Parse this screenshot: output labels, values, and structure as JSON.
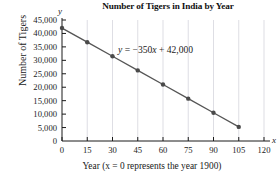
{
  "chart_data": {
    "type": "line",
    "title": "Number of Tigers in India by Year",
    "xlabel": "Year (x = 0 represents the year 1900)",
    "ylabel": "Number of Tigers",
    "x_axis_variable": "x",
    "y_axis_variable": "y",
    "annotation": "y = −350x + 42,000",
    "annotation_parts": {
      "lhs": "y",
      "rhs": " = −350",
      "var": "x",
      "tail": " + 42,000"
    },
    "x": [
      0,
      15,
      30,
      45,
      60,
      75,
      90,
      105
    ],
    "values": [
      42000,
      36750,
      31500,
      26250,
      21000,
      15750,
      10500,
      5250
    ],
    "xlim": [
      0,
      120
    ],
    "ylim": [
      0,
      45000
    ],
    "x_ticks": [
      0,
      15,
      30,
      45,
      60,
      75,
      90,
      105,
      120
    ],
    "x_tick_labels": [
      "0",
      "15",
      "30",
      "45",
      "60",
      "75",
      "90",
      "105",
      "120"
    ],
    "y_ticks": [
      0,
      5000,
      10000,
      15000,
      20000,
      25000,
      30000,
      35000,
      40000,
      45000
    ],
    "y_tick_labels": [
      "0",
      "5,000",
      "10,000",
      "15,000",
      "20,000",
      "25,000",
      "30,000",
      "35,000",
      "40,000",
      "45,000"
    ],
    "grid": "vertical",
    "legend": "none",
    "series_color": "#555555",
    "marker_color": "#4a4a4a",
    "grid_color": "#c8c8d2",
    "axis_color": "#1a1a1a"
  }
}
